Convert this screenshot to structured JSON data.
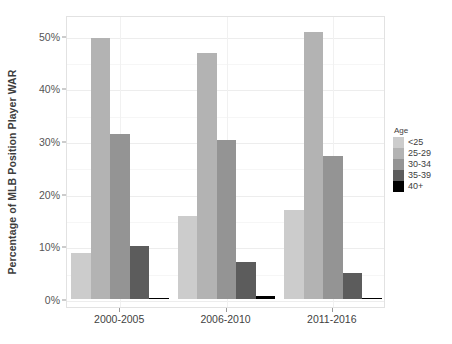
{
  "chart_data": {
    "type": "bar",
    "title": "",
    "xlabel": "",
    "ylabel": "Percentage of MLB Position Player WAR",
    "categories": [
      "2000-2005",
      "2006-2010",
      "2011-2016"
    ],
    "ylim": [
      0,
      52
    ],
    "ytick_values": [
      0,
      10,
      20,
      30,
      40,
      50
    ],
    "ytick_labels": [
      "0%",
      "10%",
      "20%",
      "30%",
      "40%",
      "50%"
    ],
    "grid": true,
    "legend_position": "right",
    "legend_title": "Age",
    "series": [
      {
        "name": "<25",
        "color": "#cccccc",
        "values": [
          8.8,
          15.7,
          16.9
        ]
      },
      {
        "name": "25-29",
        "color": "#b3b3b3",
        "values": [
          49.5,
          46.6,
          50.7
        ]
      },
      {
        "name": "30-34",
        "color": "#949494",
        "values": [
          31.3,
          30.1,
          27.2
        ]
      },
      {
        "name": "35-39",
        "color": "#5c5c5c",
        "values": [
          10.0,
          7.0,
          5.0
        ]
      },
      {
        "name": "40+",
        "color": "#000000",
        "values": [
          0.2,
          0.6,
          0.2
        ]
      }
    ]
  },
  "y_axis": {
    "title": "Percentage of MLB Position Player WAR",
    "ticks": [
      "0%",
      "10%",
      "20%",
      "30%",
      "40%",
      "50%"
    ]
  },
  "x_axis": {
    "ticks": [
      "2000-2005",
      "2006-2010",
      "2011-2016"
    ]
  },
  "legend": {
    "title": "Age",
    "items": [
      {
        "label": "<25",
        "color": "#cccccc"
      },
      {
        "label": "25-29",
        "color": "#b3b3b3"
      },
      {
        "label": "30-34",
        "color": "#949494"
      },
      {
        "label": "35-39",
        "color": "#5c5c5c"
      },
      {
        "label": "40+",
        "color": "#000000"
      }
    ]
  }
}
